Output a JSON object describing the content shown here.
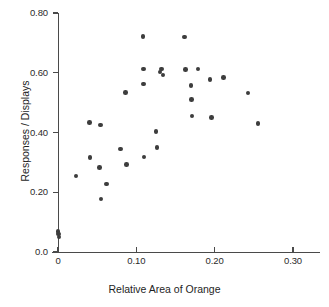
{
  "chart_data": {
    "type": "scatter",
    "title": "",
    "xlabel": "Relative Area of Orange",
    "ylabel": "Responses / Displays",
    "xlim": [
      0.0,
      0.335
    ],
    "ylim": [
      0.0,
      0.8
    ],
    "xticks": [
      0.0,
      0.1,
      0.2,
      0.3
    ],
    "xtick_labels": [
      "0",
      "0.10",
      "0.20",
      "0.30"
    ],
    "yticks": [
      0.0,
      0.2,
      0.4,
      0.6,
      0.8
    ],
    "ytick_labels": [
      "0.0",
      "0.20",
      "0.40",
      "0.60",
      "0.80"
    ],
    "grid": false,
    "legend": null,
    "marker": "filled-circle",
    "marker_color": "#3d3d3d",
    "axis_color": "#4a4a4a",
    "points": [
      {
        "x": 0.0,
        "y": 0.068
      },
      {
        "x": 0.001,
        "y": 0.06
      },
      {
        "x": 0.0015,
        "y": 0.05
      },
      {
        "x": 0.023,
        "y": 0.255
      },
      {
        "x": 0.0405,
        "y": 0.433
      },
      {
        "x": 0.041,
        "y": 0.317
      },
      {
        "x": 0.053,
        "y": 0.283
      },
      {
        "x": 0.0545,
        "y": 0.425
      },
      {
        "x": 0.055,
        "y": 0.177
      },
      {
        "x": 0.062,
        "y": 0.228
      },
      {
        "x": 0.0795,
        "y": 0.345
      },
      {
        "x": 0.0865,
        "y": 0.533
      },
      {
        "x": 0.0875,
        "y": 0.292
      },
      {
        "x": 0.1085,
        "y": 0.722
      },
      {
        "x": 0.109,
        "y": 0.613
      },
      {
        "x": 0.1095,
        "y": 0.563
      },
      {
        "x": 0.11,
        "y": 0.318
      },
      {
        "x": 0.125,
        "y": 0.403
      },
      {
        "x": 0.1265,
        "y": 0.35
      },
      {
        "x": 0.13,
        "y": 0.603
      },
      {
        "x": 0.1325,
        "y": 0.612
      },
      {
        "x": 0.134,
        "y": 0.593
      },
      {
        "x": 0.1615,
        "y": 0.72
      },
      {
        "x": 0.1625,
        "y": 0.61
      },
      {
        "x": 0.17,
        "y": 0.557
      },
      {
        "x": 0.1705,
        "y": 0.51
      },
      {
        "x": 0.171,
        "y": 0.455
      },
      {
        "x": 0.1785,
        "y": 0.612
      },
      {
        "x": 0.194,
        "y": 0.578
      },
      {
        "x": 0.196,
        "y": 0.45
      },
      {
        "x": 0.211,
        "y": 0.585
      },
      {
        "x": 0.2425,
        "y": 0.532
      },
      {
        "x": 0.2555,
        "y": 0.43
      }
    ]
  }
}
